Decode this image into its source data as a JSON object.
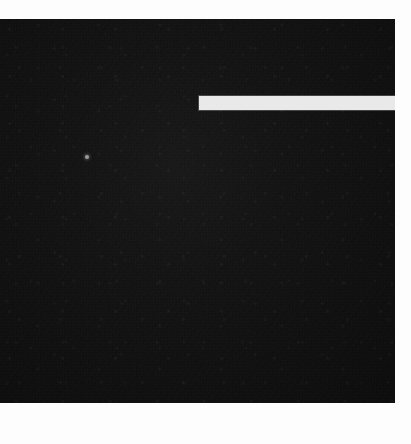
{
  "capture": {
    "width": 411,
    "height": 444,
    "description": "Blank dark application window capture"
  },
  "colors": {
    "page_background": "#fdfdfd",
    "panel_background": "#0a0a0a",
    "light_bar": "#e9e9e9",
    "speck": "#9a9a9a"
  },
  "panel": {
    "name": "blank-dark-screen",
    "x": 0,
    "y": 19,
    "width": 395,
    "height": 384,
    "visible_text": ""
  },
  "light_bar": {
    "name": "light-horizontal-bar",
    "x": 199,
    "y": 96,
    "width": 212,
    "height": 14,
    "visible_text": ""
  },
  "speck": {
    "name": "bright-speck",
    "x": 85,
    "y": 155,
    "size": 4,
    "visible_text": ""
  },
  "margins": {
    "top": {
      "x": 0,
      "y": 0,
      "width": 411,
      "height": 19
    },
    "right": {
      "x": 395,
      "y": 19,
      "width": 16,
      "height": 384
    },
    "bottom": {
      "x": 0,
      "y": 403,
      "width": 411,
      "height": 41
    }
  }
}
